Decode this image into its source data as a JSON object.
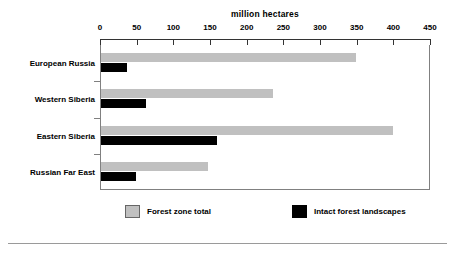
{
  "chart_data": {
    "type": "bar",
    "orientation": "horizontal",
    "title": "",
    "xlabel": "million hectares",
    "ylabel": "",
    "xlim": [
      0,
      450
    ],
    "xticks": [
      0,
      50,
      100,
      150,
      200,
      250,
      300,
      350,
      400,
      450
    ],
    "grid": false,
    "legend_position": "bottom",
    "categories": [
      "European Russia",
      "Western Siberia",
      "Eastern Siberia",
      "Russian Far East"
    ],
    "series": [
      {
        "name": "Forest zone total",
        "color": "#c0c0c0",
        "values": [
          348,
          235,
          398,
          146
        ]
      },
      {
        "name": "Intact forest landscapes",
        "color": "#000000",
        "values": [
          35,
          61,
          158,
          48
        ]
      }
    ]
  },
  "axis": {
    "title": "million hectares",
    "tick_labels": [
      "0",
      "50",
      "100",
      "150",
      "200",
      "250",
      "300",
      "350",
      "400",
      "450"
    ]
  },
  "categories": [
    {
      "label": "European Russia"
    },
    {
      "label": "Western Siberia"
    },
    {
      "label": "Eastern Siberia"
    },
    {
      "label": "Russian Far East"
    }
  ],
  "legend": {
    "items": [
      {
        "label": "Forest zone total",
        "color": "#c0c0c0"
      },
      {
        "label": "Intact forest landscapes",
        "color": "#000000"
      }
    ]
  }
}
